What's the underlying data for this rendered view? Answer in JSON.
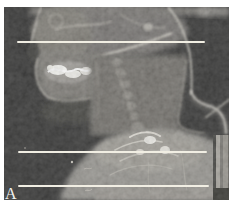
{
  "figure": {
    "panel_label": "A",
    "colors": {
      "page_background": "#ffffff",
      "film_background": "#1b1b1a",
      "scan_line": "#f1eee3",
      "panel_label_color": "#f2f2ee"
    },
    "scan_lines": [
      {
        "name": "upper-scan-line",
        "y": 42,
        "x1": 18,
        "x2": 204
      },
      {
        "name": "middle-scan-line",
        "y": 152,
        "x1": 19,
        "x2": 206
      },
      {
        "name": "lower-scan-line",
        "y": 186,
        "x1": 19,
        "x2": 208
      }
    ]
  }
}
